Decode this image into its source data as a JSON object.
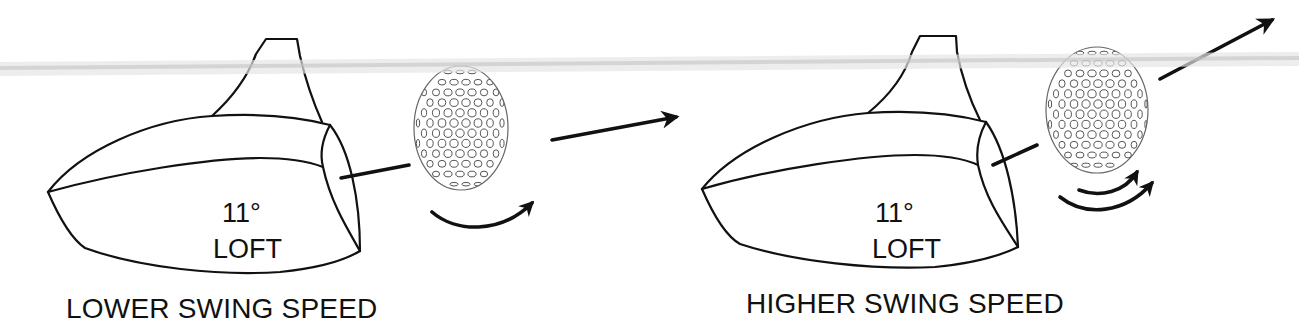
{
  "diagram": {
    "topic": "Driver loft vs swing speed — launch and spin",
    "band_color": "#d9d9d9",
    "line_color": "#111111",
    "panels": [
      {
        "id": "lower",
        "caption": "LOWER SWING SPEED",
        "loft_value": "11°",
        "loft_label": "LOFT",
        "spin_arrows": 1,
        "trajectory": "low"
      },
      {
        "id": "higher",
        "caption": "HIGHER SWING SPEED",
        "loft_value": "11°",
        "loft_label": "LOFT",
        "spin_arrows": 2,
        "trajectory": "high"
      }
    ]
  }
}
